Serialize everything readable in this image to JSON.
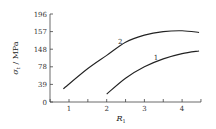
{
  "chart_data": {
    "type": "line",
    "title": "",
    "xlabel": "R1",
    "xlabel_main": "R",
    "xlabel_sub": "1",
    "ylabel": "σt / MPa",
    "ylabel_main": "σ",
    "ylabel_sub": "t",
    "ylabel_unit": " / MPa",
    "x_ticks": [
      "1",
      "2",
      "3",
      "4"
    ],
    "y_ticks": [
      "0",
      "39",
      "78",
      "148",
      "157",
      "196"
    ],
    "xlim": [
      0.5,
      4.5
    ],
    "ylim_tick_index": [
      0,
      5
    ],
    "grid": false,
    "legend": "none (curves labelled inline)",
    "series": [
      {
        "name": "1",
        "x": [
          2.0,
          2.5,
          3.0,
          3.5,
          4.0,
          4.45
        ],
        "y_tick_position": [
          0.45,
          1.35,
          2.0,
          2.45,
          2.75,
          2.9
        ],
        "label_position": {
          "x": 3.25,
          "y_tick": 2.4
        }
      },
      {
        "name": "2",
        "x": [
          0.85,
          1.5,
          2.0,
          2.5,
          3.0,
          3.5,
          4.0,
          4.45
        ],
        "y_tick_position": [
          0.75,
          1.9,
          2.65,
          3.4,
          3.8,
          4.0,
          4.05,
          3.95
        ],
        "label_position": {
          "x": 2.3,
          "y_tick": 3.3
        }
      }
    ]
  }
}
